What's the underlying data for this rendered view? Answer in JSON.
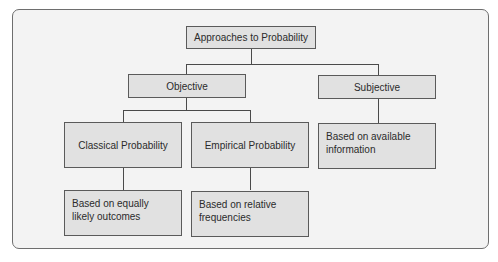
{
  "diagram": {
    "type": "hierarchy",
    "root": {
      "label": "Approaches to Probability"
    },
    "level1": [
      {
        "id": "objective",
        "label": "Objective"
      },
      {
        "id": "subjective",
        "label": "Subjective"
      }
    ],
    "level2": [
      {
        "id": "classical",
        "label": "Classical Probability",
        "parent": "objective"
      },
      {
        "id": "empirical",
        "label": "Empirical Probability",
        "parent": "objective"
      },
      {
        "id": "subjective_desc",
        "label": "Based on available information",
        "parent": "subjective"
      }
    ],
    "level3": [
      {
        "id": "classical_desc",
        "label": "Based on equally likely outcomes",
        "parent": "classical"
      },
      {
        "id": "empirical_desc",
        "label": "Based on relative frequencies",
        "parent": "empirical"
      }
    ]
  },
  "colors": {
    "box_fill": "#e1e1e1",
    "box_border": "#5a5a5a",
    "frame_fill": "#f3f3f3",
    "frame_border": "#6e6e6e",
    "line": "#4a4a4a"
  }
}
